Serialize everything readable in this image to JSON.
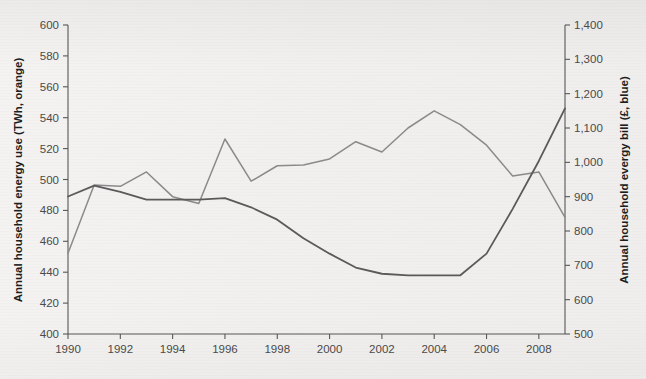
{
  "chart_data": {
    "type": "line",
    "title": "",
    "xlabel": "",
    "x": [
      1990,
      1991,
      1992,
      1993,
      1994,
      1995,
      1996,
      1997,
      1998,
      1999,
      2000,
      2001,
      2002,
      2003,
      2004,
      2005,
      2006,
      2007,
      2008,
      2009
    ],
    "x_tick_labels": [
      "1990",
      "1992",
      "1994",
      "1996",
      "1998",
      "2000",
      "2002",
      "2004",
      "2006",
      "2008"
    ],
    "x_ticks": [
      1990,
      1992,
      1994,
      1996,
      1998,
      2000,
      2002,
      2004,
      2006,
      2008
    ],
    "xlim": [
      1990,
      2009
    ],
    "grid": false,
    "legend": "none (series identified via axis titles: orange = energy use, blue = energy bill)",
    "axes": [
      {
        "id": "left",
        "ylabel": "Annual household energy use (TWh, orange)",
        "ylim": [
          400,
          600
        ],
        "ytick_step": 20,
        "ytick_labels": [
          "400",
          "420",
          "440",
          "460",
          "480",
          "500",
          "520",
          "540",
          "560",
          "580",
          "600"
        ]
      },
      {
        "id": "right",
        "ylabel": "Annual household evergy bill (£, blue)",
        "ylim": [
          500,
          1400
        ],
        "ytick_step": 100,
        "ytick_labels": [
          "500",
          "600",
          "700",
          "800",
          "900",
          "1,000",
          "1,100",
          "1,200",
          "1,300",
          "1,400"
        ]
      }
    ],
    "series": [
      {
        "name": "Annual household energy use (TWh)",
        "axis": "left",
        "color_named": "orange",
        "rendered_color": "#5a5a5a",
        "units": "TWh",
        "values": [
          489,
          496,
          492,
          487,
          487,
          487,
          488,
          482,
          474,
          462,
          452,
          443,
          439,
          438,
          438,
          438,
          452,
          481,
          512,
          546
        ]
      },
      {
        "name": "Annual household energy bill (£)",
        "axis": "right",
        "color_named": "blue",
        "rendered_color": "#8a8a8a",
        "units": "£",
        "values": [
          735,
          934,
          930,
          972,
          900,
          880,
          1068,
          945,
          990,
          992,
          1010,
          1060,
          1030,
          1100,
          1150,
          1110,
          1050,
          960,
          972,
          840
        ]
      }
    ]
  },
  "axis_titles": {
    "left": "Annual household energy use (TWh, orange)",
    "right": "Annual household evergy bill (£, blue)"
  },
  "colors": {
    "background": "#f2f1ef",
    "axis": "#575757",
    "tick_text": "#4a4a4a",
    "title_text": "#1d1d1d",
    "series_energy_use": "#5a5a5a",
    "series_energy_bill": "#8a8a8a"
  }
}
